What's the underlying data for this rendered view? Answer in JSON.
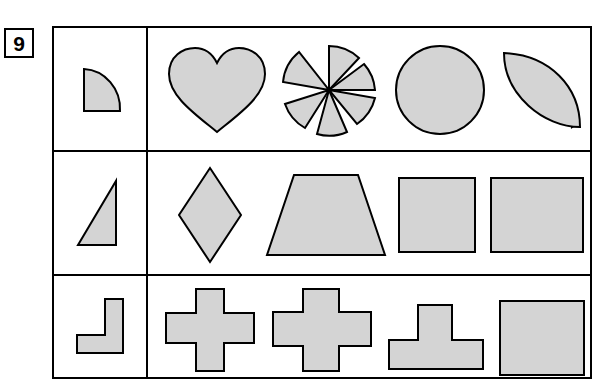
{
  "page": {
    "background_color": "#ffffff",
    "ink_color": "#000000",
    "shape_fill_color": "#d4d4d4"
  },
  "question": {
    "number": "9",
    "number_box_name": "question-number-box"
  },
  "worksheet": {
    "rows": [
      {
        "id": "row-1",
        "prompt": {
          "label": "quarter-circle-wedge",
          "shape": "quarter-circle"
        },
        "options": [
          {
            "label": "heart",
            "shape": "heart"
          },
          {
            "label": "pinwheel-six-sectors",
            "shape": "pinwheel"
          },
          {
            "label": "circle",
            "shape": "circle"
          },
          {
            "label": "half-disc-crescent",
            "shape": "half-disc"
          }
        ]
      },
      {
        "id": "row-2",
        "prompt": {
          "label": "right-triangle",
          "shape": "right-triangle"
        },
        "options": [
          {
            "label": "rhombus",
            "shape": "rhombus"
          },
          {
            "label": "trapezoid",
            "shape": "trapezoid"
          },
          {
            "label": "square",
            "shape": "square"
          },
          {
            "label": "rectangle",
            "shape": "rectangle"
          }
        ]
      },
      {
        "id": "row-3",
        "prompt": {
          "label": "L-shape",
          "shape": "el-shape"
        },
        "options": [
          {
            "label": "plus-cross-thin",
            "shape": "cross-thin"
          },
          {
            "label": "plus-cross-thick",
            "shape": "cross-thick"
          },
          {
            "label": "t-shape",
            "shape": "t-shape"
          },
          {
            "label": "square-large",
            "shape": "square-large"
          }
        ]
      }
    ]
  }
}
